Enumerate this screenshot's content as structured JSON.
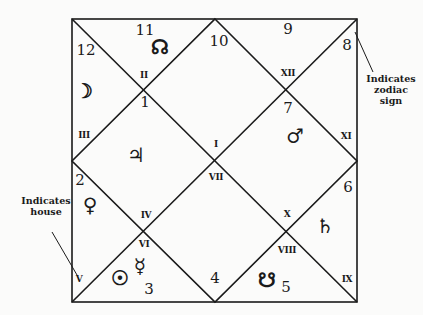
{
  "chart": {
    "type": "north-indian-horoscope",
    "frame": {
      "x1": 72,
      "y1": 19,
      "x2": 357,
      "y2": 302,
      "stroke": "#1a1a1a"
    },
    "houses": [
      {
        "house": "I",
        "sign": "1",
        "planets": [
          "jupiter"
        ]
      },
      {
        "house": "II",
        "sign": "12",
        "planets": [
          "moon"
        ]
      },
      {
        "house": "III",
        "sign": "11",
        "planets": [
          "north-node"
        ]
      },
      {
        "house": "IV",
        "sign": "2",
        "planets": [
          "venus"
        ]
      },
      {
        "house": "V",
        "sign": "3",
        "planets": [
          "sun",
          "mercury"
        ]
      },
      {
        "house": "VI",
        "sign": "4",
        "planets": []
      },
      {
        "house": "VII",
        "sign": "7",
        "planets": [
          "mars"
        ]
      },
      {
        "house": "VIII",
        "sign": "5",
        "planets": [
          "south-node"
        ]
      },
      {
        "house": "IX",
        "sign": "6",
        "planets": [
          "saturn"
        ]
      },
      {
        "house": "X",
        "sign": "9",
        "planets": []
      },
      {
        "house": "XI",
        "sign": "8",
        "planets": []
      },
      {
        "house": "XII",
        "sign": "10",
        "planets": []
      }
    ]
  },
  "labels": {
    "signs": {
      "s11": "11",
      "s10": "10",
      "s9": "9",
      "s12": "12",
      "s8": "8",
      "s1": "1",
      "s7": "7",
      "s2": "2",
      "s6": "6",
      "s3": "3",
      "s4": "4",
      "s5": "5"
    },
    "houses": {
      "h2": "II",
      "h12": "XII",
      "h1": "I",
      "h7": "VII",
      "h3": "III",
      "h11": "XI",
      "h4": "IV",
      "h10": "X",
      "h6": "VI",
      "h8": "VIII",
      "h5": "V",
      "h9": "IX"
    },
    "planets": {
      "north_node": "☊",
      "moon": "☽",
      "jupiter": "♃",
      "mars": "♂",
      "venus": "♀",
      "saturn": "♄",
      "sun": "☉",
      "mercury": "☿",
      "south_node": "☋"
    }
  },
  "annotations": {
    "zodiac_note": {
      "line1": "Indicates",
      "line2": "zodiac",
      "line3": "sign"
    },
    "house_note": {
      "line1": "Indicates",
      "line2": "house"
    }
  }
}
